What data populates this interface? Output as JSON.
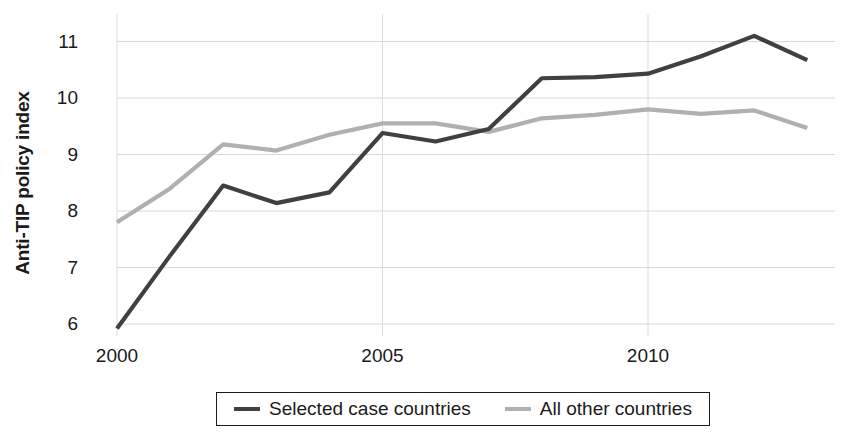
{
  "chart_data": {
    "type": "line",
    "title": "",
    "xlabel": "",
    "ylabel": "Anti-TIP policy index",
    "x": [
      2000,
      2001,
      2002,
      2003,
      2004,
      2005,
      2006,
      2007,
      2008,
      2009,
      2010,
      2011,
      2012,
      2013
    ],
    "xlim": [
      2000,
      2013
    ],
    "ylim": [
      5.6,
      11.35
    ],
    "xticks": [
      2000,
      2005,
      2010
    ],
    "xtick_labels": [
      "2000",
      "2005",
      "2010"
    ],
    "yticks": [
      6,
      7,
      8,
      9,
      10,
      11
    ],
    "ytick_labels": [
      "6",
      "7",
      "8",
      "9",
      "10",
      "11"
    ],
    "grid": true,
    "legend_position": "bottom-center",
    "series": [
      {
        "name": "Selected case countries",
        "color": "#404040",
        "values": [
          5.92,
          7.21,
          8.45,
          8.14,
          8.33,
          9.38,
          9.23,
          9.45,
          10.35,
          10.37,
          10.43,
          10.74,
          11.1,
          10.67
        ]
      },
      {
        "name": "All other countries",
        "color": "#b0b0b0",
        "values": [
          7.8,
          8.4,
          9.18,
          9.07,
          9.35,
          9.55,
          9.55,
          9.4,
          9.64,
          9.7,
          9.8,
          9.72,
          9.78,
          9.47
        ]
      }
    ]
  },
  "axis": {
    "y_title": "Anti-TIP policy index"
  },
  "legend": {
    "items": [
      {
        "label": "Selected case countries"
      },
      {
        "label": "All other countries"
      }
    ]
  }
}
